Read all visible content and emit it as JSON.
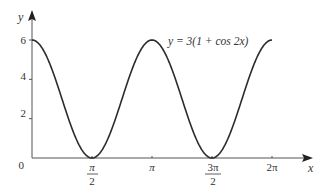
{
  "chart_data": {
    "type": "line",
    "title": "",
    "equation_label": "y = 3(1 + cos 2x)",
    "xlabel": "x",
    "ylabel": "y",
    "xlim": [
      0,
      6.2832
    ],
    "ylim": [
      0,
      6
    ],
    "grid": false,
    "legend": "none",
    "x_ticks": [
      {
        "value": 1.5708,
        "label_num": "π",
        "label_den": "2"
      },
      {
        "value": 3.1416,
        "label": "π"
      },
      {
        "value": 4.7124,
        "label_num": "3π",
        "label_den": "2"
      },
      {
        "value": 6.2832,
        "label": "2π"
      }
    ],
    "y_ticks": [
      {
        "value": 2,
        "label": "2"
      },
      {
        "value": 4,
        "label": "4"
      },
      {
        "value": 6,
        "label": "6"
      }
    ],
    "origin_label": "0",
    "series": [
      {
        "name": "y = 3(1 + cos 2x)",
        "function": "3*(1+cos(2x))",
        "x": [
          0,
          0.3927,
          0.7854,
          1.1781,
          1.5708,
          1.9635,
          2.3562,
          2.7489,
          3.1416,
          3.5343,
          3.927,
          4.3197,
          4.7124,
          5.1051,
          5.4978,
          5.8905,
          6.2832
        ],
        "values": [
          6,
          5.12,
          3,
          0.88,
          0,
          0.88,
          3,
          5.12,
          6,
          5.12,
          3,
          0.88,
          0,
          0.88,
          3,
          5.12,
          6
        ]
      }
    ]
  },
  "colors": {
    "curve": "#2b2b2b",
    "axis": "#555555",
    "text": "#333333"
  }
}
